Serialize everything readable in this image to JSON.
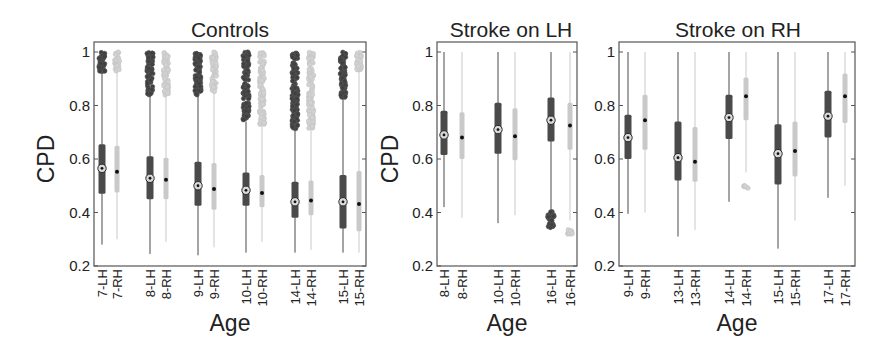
{
  "chart_data": [
    {
      "type": "box",
      "title": "Controls",
      "xlabel": "Age",
      "ylabel": "CPD",
      "ylim": [
        0.2,
        1.0
      ],
      "yticks": [
        "0.2",
        "0.4",
        "0.6",
        "0.8",
        "1"
      ],
      "grid": false,
      "categories": [
        "7-LH",
        "7-RH",
        "8-LH",
        "8-RH",
        "9-LH",
        "9-RH",
        "10-LH",
        "10-RH",
        "14-LH",
        "14-RH",
        "15-LH",
        "15-RH"
      ],
      "series": [
        {
          "label": "7-LH",
          "hemi": "LH",
          "median": 0.565,
          "q1": 0.47,
          "q3": 0.655,
          "whisker_low": 0.28,
          "whisker_high": 0.925,
          "outliers_range": [
            0.925,
            1.0
          ]
        },
        {
          "label": "7-RH",
          "hemi": "RH",
          "median": 0.552,
          "q1": 0.475,
          "q3": 0.65,
          "whisker_low": 0.3,
          "whisker_high": 0.93,
          "outliers_range": [
            0.93,
            1.0
          ]
        },
        {
          "label": "8-LH",
          "hemi": "LH",
          "median": 0.528,
          "q1": 0.45,
          "q3": 0.61,
          "whisker_low": 0.245,
          "whisker_high": 0.84,
          "outliers_range": [
            0.84,
            1.0
          ]
        },
        {
          "label": "8-RH",
          "hemi": "RH",
          "median": 0.522,
          "q1": 0.45,
          "q3": 0.605,
          "whisker_low": 0.29,
          "whisker_high": 0.835,
          "outliers_range": [
            0.835,
            1.0
          ]
        },
        {
          "label": "9-LH",
          "hemi": "LH",
          "median": 0.5,
          "q1": 0.425,
          "q3": 0.59,
          "whisker_low": 0.24,
          "whisker_high": 0.835,
          "outliers_range": [
            0.835,
            1.0
          ]
        },
        {
          "label": "9-RH",
          "hemi": "RH",
          "median": 0.488,
          "q1": 0.41,
          "q3": 0.585,
          "whisker_low": 0.27,
          "whisker_high": 0.85,
          "outliers_range": [
            0.85,
            1.0
          ]
        },
        {
          "label": "10-LH",
          "hemi": "LH",
          "median": 0.483,
          "q1": 0.425,
          "q3": 0.55,
          "whisker_low": 0.25,
          "whisker_high": 0.74,
          "outliers_range": [
            0.74,
            1.0
          ]
        },
        {
          "label": "10-RH",
          "hemi": "RH",
          "median": 0.473,
          "q1": 0.42,
          "q3": 0.54,
          "whisker_low": 0.29,
          "whisker_high": 0.73,
          "outliers_range": [
            0.73,
            1.0
          ]
        },
        {
          "label": "14-LH",
          "hemi": "LH",
          "median": 0.44,
          "q1": 0.38,
          "q3": 0.515,
          "whisker_low": 0.25,
          "whisker_high": 0.71,
          "outliers_range": [
            0.71,
            1.0
          ]
        },
        {
          "label": "14-RH",
          "hemi": "RH",
          "median": 0.445,
          "q1": 0.39,
          "q3": 0.52,
          "whisker_low": 0.26,
          "whisker_high": 0.715,
          "outliers_range": [
            0.715,
            1.0
          ]
        },
        {
          "label": "15-LH",
          "hemi": "LH",
          "median": 0.44,
          "q1": 0.34,
          "q3": 0.54,
          "whisker_low": 0.25,
          "whisker_high": 0.83,
          "outliers_range": [
            0.83,
            1.0
          ]
        },
        {
          "label": "15-RH",
          "hemi": "RH",
          "median": 0.432,
          "q1": 0.33,
          "q3": 0.555,
          "whisker_low": 0.25,
          "whisker_high": 0.93,
          "outliers_range": [
            0.93,
            1.0
          ]
        }
      ]
    },
    {
      "type": "box",
      "title": "Stroke on LH",
      "xlabel": "Age",
      "ylabel": "CPD",
      "ylim": [
        0.2,
        1.0
      ],
      "yticks": [
        "0.2",
        "0.4",
        "0.6",
        "0.8",
        "1"
      ],
      "grid": false,
      "categories": [
        "8-LH",
        "8-RH",
        "10-LH",
        "10-RH",
        "16-LH",
        "16-RH"
      ],
      "series": [
        {
          "label": "8-LH",
          "hemi": "LH",
          "median": 0.69,
          "q1": 0.615,
          "q3": 0.78,
          "whisker_low": 0.42,
          "whisker_high": 1.0
        },
        {
          "label": "8-RH",
          "hemi": "RH",
          "median": 0.68,
          "q1": 0.6,
          "q3": 0.775,
          "whisker_low": 0.38,
          "whisker_high": 1.0
        },
        {
          "label": "10-LH",
          "hemi": "LH",
          "median": 0.71,
          "q1": 0.62,
          "q3": 0.81,
          "whisker_low": 0.36,
          "whisker_high": 1.0
        },
        {
          "label": "10-RH",
          "hemi": "RH",
          "median": 0.685,
          "q1": 0.595,
          "q3": 0.79,
          "whisker_low": 0.39,
          "whisker_high": 1.0
        },
        {
          "label": "16-LH",
          "hemi": "LH",
          "median": 0.745,
          "q1": 0.665,
          "q3": 0.83,
          "whisker_low": 0.41,
          "whisker_high": 1.0,
          "outliers_range": [
            0.335,
            0.405
          ]
        },
        {
          "label": "16-RH",
          "hemi": "RH",
          "median": 0.725,
          "q1": 0.635,
          "q3": 0.81,
          "whisker_low": 0.37,
          "whisker_high": 1.0,
          "outliers_range": [
            0.315,
            0.34
          ]
        }
      ]
    },
    {
      "type": "box",
      "title": "Stroke on RH",
      "xlabel": "Age",
      "ylabel": "",
      "ylim": [
        0.2,
        1.0
      ],
      "yticks": [
        "0.2",
        "0.4",
        "0.6",
        "0.8",
        "1"
      ],
      "grid": false,
      "categories": [
        "9-LH",
        "9-RH",
        "13-LH",
        "13-RH",
        "14-LH",
        "14-RH",
        "15-LH",
        "15-RH",
        "17-LH",
        "17-RH"
      ],
      "series": [
        {
          "label": "9-LH",
          "hemi": "LH",
          "median": 0.68,
          "q1": 0.6,
          "q3": 0.765,
          "whisker_low": 0.395,
          "whisker_high": 1.0
        },
        {
          "label": "9-RH",
          "hemi": "RH",
          "median": 0.745,
          "q1": 0.635,
          "q3": 0.84,
          "whisker_low": 0.4,
          "whisker_high": 1.0
        },
        {
          "label": "13-LH",
          "hemi": "LH",
          "median": 0.605,
          "q1": 0.52,
          "q3": 0.74,
          "whisker_low": 0.31,
          "whisker_high": 1.0
        },
        {
          "label": "13-RH",
          "hemi": "RH",
          "median": 0.59,
          "q1": 0.515,
          "q3": 0.72,
          "whisker_low": 0.335,
          "whisker_high": 1.0
        },
        {
          "label": "14-LH",
          "hemi": "LH",
          "median": 0.755,
          "q1": 0.675,
          "q3": 0.84,
          "whisker_low": 0.44,
          "whisker_high": 1.0
        },
        {
          "label": "14-RH",
          "hemi": "RH",
          "median": 0.835,
          "q1": 0.745,
          "q3": 0.905,
          "whisker_low": 0.55,
          "whisker_high": 1.0,
          "outliers_range": [
            0.49,
            0.5
          ]
        },
        {
          "label": "15-LH",
          "hemi": "LH",
          "median": 0.62,
          "q1": 0.505,
          "q3": 0.73,
          "whisker_low": 0.265,
          "whisker_high": 1.0
        },
        {
          "label": "15-RH",
          "hemi": "RH",
          "median": 0.63,
          "q1": 0.535,
          "q3": 0.74,
          "whisker_low": 0.37,
          "whisker_high": 1.0
        },
        {
          "label": "17-LH",
          "hemi": "LH",
          "median": 0.76,
          "q1": 0.68,
          "q3": 0.855,
          "whisker_low": 0.455,
          "whisker_high": 1.0
        },
        {
          "label": "17-RH",
          "hemi": "RH",
          "median": 0.835,
          "q1": 0.735,
          "q3": 0.92,
          "whisker_low": 0.5,
          "whisker_high": 1.0
        }
      ]
    }
  ],
  "style": {
    "lh_color": "#4a4a4a",
    "rh_color": "#c9c9c9",
    "axis_color": "#555555",
    "text_color": "#222222",
    "median_ring_color": "#9a9a9a"
  },
  "layout": {
    "panels": [
      {
        "x0": 94,
        "x1": 366,
        "positions": [
          102,
          117,
          150,
          166,
          198,
          214,
          246,
          262,
          295,
          311,
          343,
          359
        ]
      },
      {
        "x0": 437,
        "x1": 577,
        "positions": [
          444,
          462,
          498,
          515,
          551,
          570
        ]
      },
      {
        "x0": 619,
        "x1": 855,
        "positions": [
          628,
          645,
          678,
          695,
          729,
          746,
          778,
          795,
          828,
          845
        ]
      }
    ],
    "y_top": 42,
    "y_at_one": 52,
    "y_bottom": 266
  }
}
